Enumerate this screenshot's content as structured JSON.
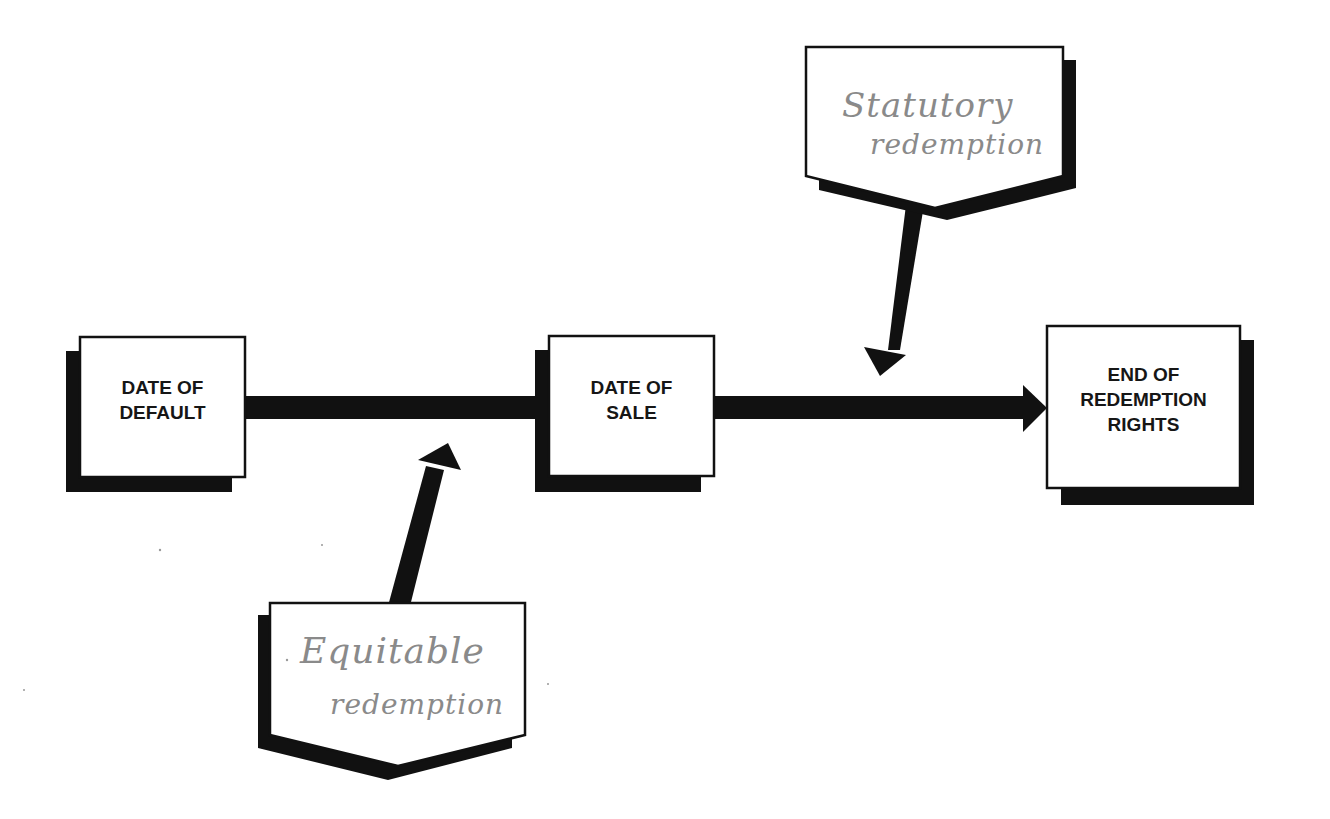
{
  "diagram": {
    "type": "timeline-flow",
    "colors": {
      "ink": "#111111",
      "box_fill": "#ffffff",
      "handwriting": "#8a8a8a",
      "background": "#ffffff"
    },
    "nodes": [
      {
        "id": "default",
        "lines": [
          "DATE OF",
          "DEFAULT"
        ]
      },
      {
        "id": "sale",
        "lines": [
          "DATE OF",
          "SALE"
        ]
      },
      {
        "id": "end",
        "lines": [
          "END OF",
          "REDEMPTION",
          "RIGHTS"
        ]
      }
    ],
    "callouts": [
      {
        "id": "statutory",
        "lines": [
          "Statutory",
          "redemption"
        ],
        "points_to": "between sale and end"
      },
      {
        "id": "equitable",
        "lines": [
          "Equitable",
          "redemption"
        ],
        "points_to": "between default and sale"
      }
    ],
    "edges": [
      {
        "from": "default",
        "to": "sale",
        "arrow": false
      },
      {
        "from": "sale",
        "to": "end",
        "arrow": true
      }
    ]
  }
}
